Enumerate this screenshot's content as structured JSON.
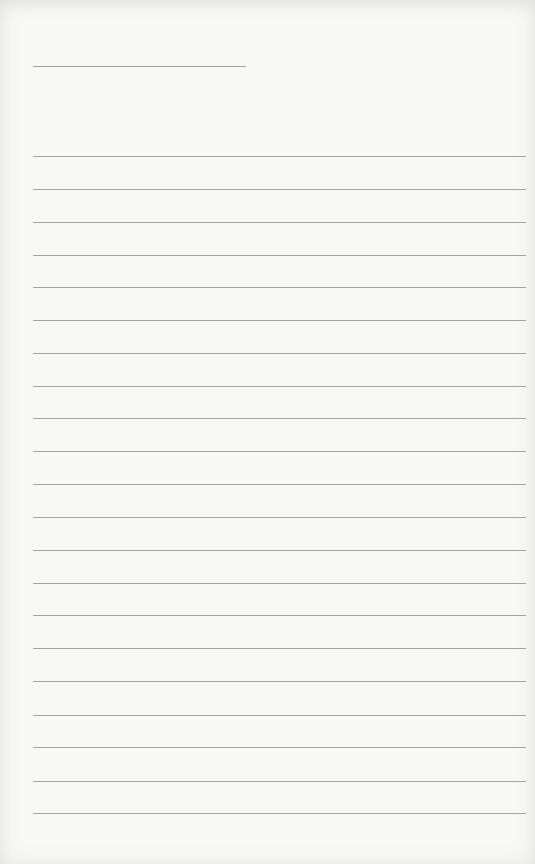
{
  "page": {
    "type": "lined-paper",
    "background_color": "#f8f8f6",
    "line_color": "#909090",
    "header_line": {
      "label": "",
      "x": 33,
      "y": 66,
      "width": 213
    },
    "ruled_lines": {
      "count": 21,
      "x": 33,
      "width": 493,
      "y_positions": [
        156,
        189,
        222,
        255,
        287,
        320,
        353,
        386,
        418,
        451,
        484,
        517,
        550,
        583,
        615,
        648,
        681,
        715,
        747,
        781,
        813
      ],
      "contents": [
        "",
        "",
        "",
        "",
        "",
        "",
        "",
        "",
        "",
        "",
        "",
        "",
        "",
        "",
        "",
        "",
        "",
        "",
        "",
        "",
        ""
      ]
    }
  }
}
